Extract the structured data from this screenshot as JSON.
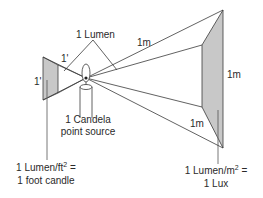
{
  "diagram": {
    "title_label": "1 Lumen",
    "small_plane": {
      "edge_label_top": "1'",
      "edge_label_side": "1'",
      "caption_line1_prefix": "1 Lumen/ft",
      "caption_line1_sup": "2",
      "caption_line1_suffix": " =",
      "caption_line2": "1 foot candle"
    },
    "source": {
      "caption_line1": "1 Candela",
      "caption_line2": "point source"
    },
    "large_plane": {
      "edge_label_top": "1m",
      "edge_label_side": "1m",
      "edge_label_bottom": "1m",
      "caption_line1_prefix": "1 Lumen/m",
      "caption_line1_sup": "2",
      "caption_line1_suffix": " =",
      "caption_line2": "1 Lux"
    },
    "colors": {
      "line": "#3a3a3a",
      "plane_fill": "#c8c8c8",
      "background": "#ffffff"
    }
  }
}
